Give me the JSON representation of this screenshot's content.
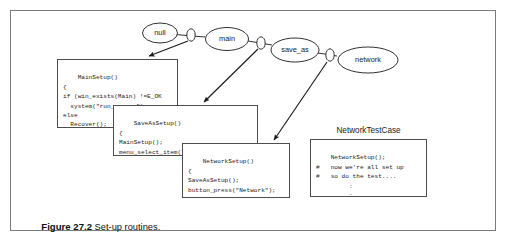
{
  "figure": {
    "caption_number": "Figure 27.2",
    "caption_text": "Set-up routines."
  },
  "graph": {
    "nodes": [
      {
        "id": "null",
        "label": "null"
      },
      {
        "id": "main",
        "label": "main"
      },
      {
        "id": "save_as",
        "label": "save_as"
      },
      {
        "id": "network",
        "label": "network"
      }
    ],
    "connector_count": 3
  },
  "boxes": {
    "mainsetup": {
      "code": "MainSetup()\n{\nif (win_exists(Main) !=E_OK\n  system(\"run_my_app\");\nelse\n  Recover();\n}"
    },
    "saveassetup": {
      "code": "SaveAsSetup()\n{\nMainSetup();\nmenu_select_item(\"File;SaveAs\");\n}"
    },
    "networksetup": {
      "code": "NetworkSetup()\n{\nSaveAsSetup();\nbutton_press(\"Network\");\n}"
    },
    "testcase": {
      "title": "NetworkTestCase",
      "code": "NetworkSetup();\n#   now we're all set up\n#   so do the test....\n         :\n         :\n#   and verify the results\n         :"
    }
  },
  "colors": {
    "frame_border": "#7b7b7b",
    "box_border": "#4d4d4d",
    "stroke": "#1a1a1a",
    "background": "#ffffff"
  }
}
